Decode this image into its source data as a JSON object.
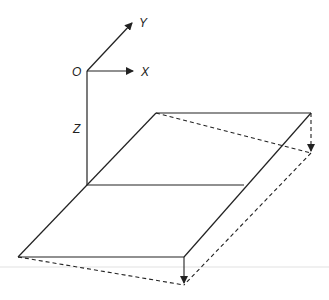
{
  "diagram": {
    "type": "plate-deflection-3d-sketch",
    "colors": {
      "stroke": "#222222",
      "background": "#ffffff"
    },
    "axes": {
      "origin_label": "O",
      "x_label": "X",
      "y_label": "Y",
      "z_label": "Z"
    },
    "plate": {
      "edges": "solid",
      "deflected_edges": "dashed",
      "deflection_arrows": 2
    }
  }
}
